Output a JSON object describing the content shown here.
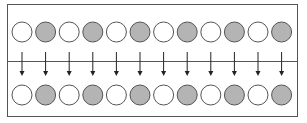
{
  "diagram": {
    "frame": {
      "x": 7.5,
      "y": 4.5,
      "width": 290,
      "height": 112,
      "stroke": "#555555"
    },
    "divider": {
      "y": 61.5,
      "stroke": "#555555"
    },
    "colors": {
      "white_fill": "#ffffff",
      "gray_fill": "#b4b4b4",
      "circle_stroke": "#555555",
      "arrow": "#222222"
    },
    "circle_radius": 10,
    "top_row": {
      "cy": 32,
      "circles": [
        "white",
        "gray",
        "white",
        "gray",
        "white",
        "gray",
        "white",
        "gray",
        "white",
        "gray",
        "white",
        "gray"
      ]
    },
    "bottom_row": {
      "cy": 95,
      "circles": [
        "white",
        "gray",
        "white",
        "gray",
        "white",
        "gray",
        "white",
        "gray",
        "white",
        "gray",
        "white",
        "gray"
      ]
    },
    "arrows": {
      "count": 12,
      "y_start": 52,
      "y_end": 76
    },
    "first_cx": 22,
    "pitch": 23.6
  }
}
